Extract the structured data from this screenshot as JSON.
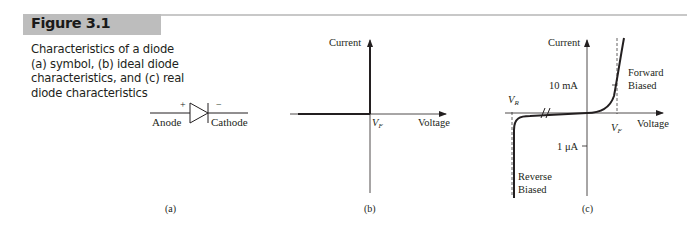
{
  "figure": {
    "number": "Figure 3.1",
    "caption_lines": [
      "Characteristics of a diode",
      "(a) symbol, (b) ideal diode",
      "characteristics, and (c) real",
      "diode characteristics"
    ],
    "header_color": "#bdbdbd"
  },
  "panel_a": {
    "label": "(a)",
    "anode_label": "Anode",
    "cathode_label": "Cathode",
    "plus_sign": "+",
    "minus_sign": "−"
  },
  "panel_b": {
    "label": "(b)",
    "y_axis_label": "Current",
    "x_axis_label": "Voltage",
    "vf_label": "V",
    "vf_sub": "F"
  },
  "panel_c": {
    "label": "(c)",
    "y_axis_label": "Current",
    "x_axis_label": "Voltage",
    "tick_10ma": "10 mA",
    "tick_1ua": "1 μA",
    "vr_label": "V",
    "vr_sub": "R",
    "vf_label": "V",
    "vf_sub": "F",
    "forward_line1": "Forward",
    "forward_line2": "Biased",
    "reverse_line1": "Reverse",
    "reverse_line2": "Biased"
  }
}
